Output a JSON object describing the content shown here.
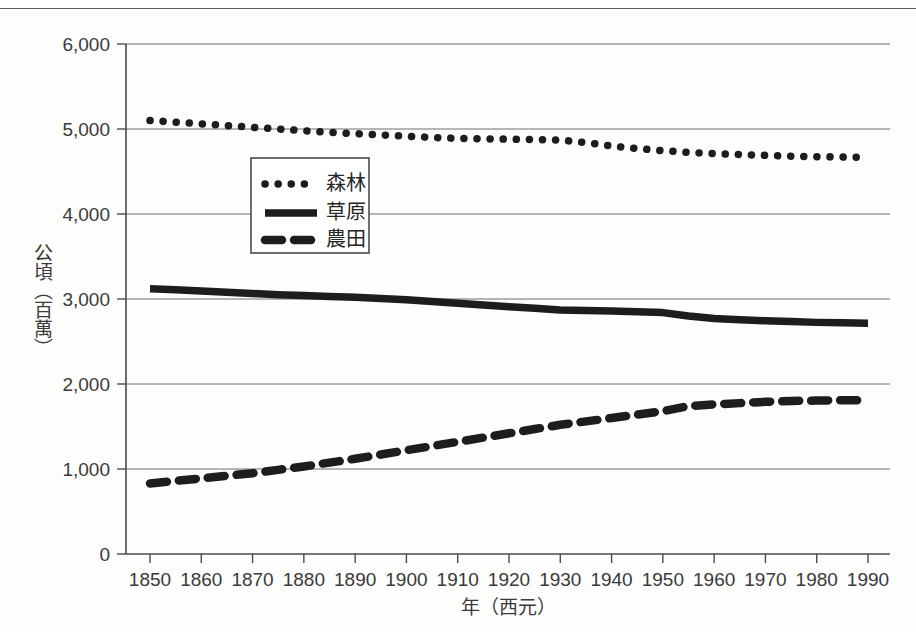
{
  "chart_data": {
    "type": "line",
    "title": "",
    "xlabel": "年（西元）",
    "ylabel": "公頃（百萬）",
    "xlim": [
      1845,
      1995
    ],
    "ylim": [
      0,
      6000
    ],
    "grid": true,
    "legend_position": "inside-upper-left",
    "x_ticks": [
      "1850",
      "1860",
      "1870",
      "1880",
      "1890",
      "1900",
      "1910",
      "1920",
      "1930",
      "1940",
      "1950",
      "1960",
      "1970",
      "1980",
      "1990"
    ],
    "y_ticks": [
      "0",
      "1,000",
      "2,000",
      "3,000",
      "4,000",
      "5,000",
      "6,000"
    ],
    "x": [
      1850,
      1855,
      1860,
      1865,
      1870,
      1875,
      1880,
      1885,
      1890,
      1895,
      1900,
      1905,
      1910,
      1915,
      1920,
      1925,
      1930,
      1935,
      1940,
      1945,
      1950,
      1955,
      1960,
      1965,
      1970,
      1975,
      1980,
      1985,
      1990
    ],
    "series": [
      {
        "name": "森林",
        "style": "dotted",
        "color": "#1d1d1d",
        "values": [
          5100,
          5080,
          5060,
          5040,
          5020,
          5000,
          4980,
          4960,
          4945,
          4930,
          4915,
          4900,
          4890,
          4885,
          4880,
          4875,
          4870,
          4840,
          4800,
          4770,
          4745,
          4725,
          4710,
          4700,
          4690,
          4680,
          4675,
          4670,
          4665
        ]
      },
      {
        "name": "草原",
        "style": "solid",
        "color": "#1d1d1d",
        "values": [
          3120,
          3110,
          3095,
          3080,
          3065,
          3050,
          3040,
          3030,
          3020,
          3005,
          2990,
          2970,
          2950,
          2930,
          2910,
          2890,
          2870,
          2865,
          2860,
          2850,
          2840,
          2800,
          2770,
          2755,
          2745,
          2735,
          2725,
          2720,
          2715
        ]
      },
      {
        "name": "農田",
        "style": "dashed",
        "color": "#1d1d1d",
        "values": [
          830,
          860,
          890,
          920,
          950,
          990,
          1030,
          1075,
          1120,
          1170,
          1220,
          1270,
          1320,
          1370,
          1420,
          1470,
          1520,
          1560,
          1600,
          1640,
          1680,
          1740,
          1760,
          1775,
          1790,
          1800,
          1805,
          1810,
          1810
        ]
      }
    ]
  },
  "legend": {
    "items": [
      {
        "label": "森林",
        "style": "dotted"
      },
      {
        "label": "草原",
        "style": "solid"
      },
      {
        "label": "農田",
        "style": "dashed"
      }
    ]
  }
}
